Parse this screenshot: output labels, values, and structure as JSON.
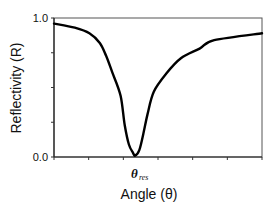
{
  "chart_data": {
    "type": "line",
    "title": "",
    "xlabel": "Angle (θ)",
    "ylabel": "Reflectivity (R)",
    "ylim": [
      0.0,
      1.0
    ],
    "xlim": [
      0,
      1
    ],
    "y_tick_labels": [
      "0.0",
      "1.0"
    ],
    "x_tick_labels": [],
    "grid": false,
    "legend": null,
    "annotations": [
      {
        "text": "θ",
        "subscript": "res",
        "x": 0.39,
        "position": "below x-axis, aligned with curve minimum"
      }
    ],
    "series": [
      {
        "name": "Reflectivity",
        "color": "#000000",
        "x": [
          0.0,
          0.1,
          0.17,
          0.22,
          0.25,
          0.28,
          0.32,
          0.34,
          0.36,
          0.38,
          0.39,
          0.41,
          0.43,
          0.45,
          0.48,
          0.54,
          0.61,
          0.7,
          0.77,
          1.0
        ],
        "values": [
          0.96,
          0.93,
          0.89,
          0.82,
          0.73,
          0.61,
          0.44,
          0.23,
          0.09,
          0.03,
          0.01,
          0.05,
          0.17,
          0.31,
          0.47,
          0.6,
          0.71,
          0.78,
          0.84,
          0.89
        ]
      }
    ]
  },
  "plot": {
    "left": 54,
    "right": 262,
    "top": 18,
    "bottom": 157
  }
}
